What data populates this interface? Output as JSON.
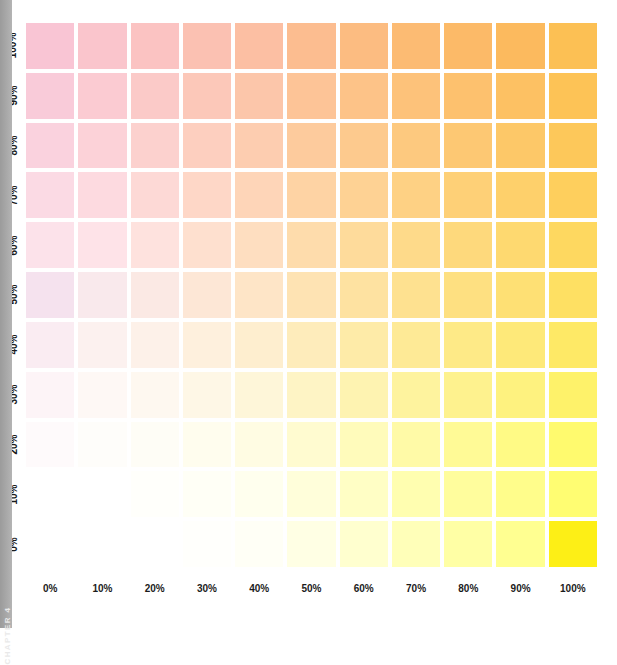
{
  "spine": {
    "chapter_label": "CHAPTER 4",
    "color": "#a6a6a6"
  },
  "chart_data": {
    "type": "heatmap",
    "title": "",
    "xlabel": "",
    "ylabel": "",
    "grid": false,
    "legend": "none",
    "x_axis_name": "yellow_percent",
    "y_axis_name": "magenta_percent",
    "x": [
      "0%",
      "10%",
      "20%",
      "30%",
      "40%",
      "50%",
      "60%",
      "70%",
      "80%",
      "90%",
      "100%"
    ],
    "y": [
      "100%",
      "90%",
      "80%",
      "70%",
      "60%",
      "50%",
      "40%",
      "30%",
      "20%",
      "10%",
      "0%"
    ],
    "x_values": [
      0,
      10,
      20,
      30,
      40,
      50,
      60,
      70,
      80,
      90,
      100
    ],
    "y_values": [
      100,
      90,
      80,
      70,
      60,
      50,
      40,
      30,
      20,
      10,
      0
    ],
    "xlim": [
      0,
      100
    ],
    "ylim": [
      0,
      100
    ],
    "corner_colors": {
      "top_left": "#f9c5d4",
      "top_right": "#fcc054",
      "bottom_left": "#ffffff",
      "bottom_right": "#fdef16"
    },
    "cell_colors": [
      [
        "#f9c5d4",
        "#fac5cc",
        "#fbc3c2",
        "#fbc1b2",
        "#fcbfa3",
        "#fcbd90",
        "#fcbc81",
        "#fcbb73",
        "#fcba68",
        "#fcba5e",
        "#fcc054"
      ],
      [
        "#f9cbd9",
        "#fbcbd2",
        "#fbcac8",
        "#fcc8b9",
        "#fcc6aa",
        "#fdc497",
        "#fdc388",
        "#fdc27a",
        "#fdc16e",
        "#fdc163",
        "#fdc356"
      ],
      [
        "#fad2de",
        "#fcd2d8",
        "#fcd1ce",
        "#fdcfbf",
        "#fdcdb0",
        "#fdcb9d",
        "#fdca8e",
        "#fdc97f",
        "#fdc873",
        "#fdc868",
        "#fdc85a"
      ],
      [
        "#fbdae4",
        "#fddae0",
        "#fdd9d6",
        "#fed7c7",
        "#fed5b8",
        "#fed3a4",
        "#fed294",
        "#fed184",
        "#fed077",
        "#fed06b",
        "#fecf5d"
      ],
      [
        "#fce2ea",
        "#fee3e8",
        "#fee2de",
        "#fee0cf",
        "#fedec0",
        "#fedcac",
        "#fedb9b",
        "#feda8a",
        "#fed97c",
        "#fed970",
        "#fed860"
      ],
      [
        "#f5e2ee",
        "#f9e9ec",
        "#fbe9e4",
        "#fde7d6",
        "#fee5c7",
        "#fee3b3",
        "#fee2a1",
        "#fee190",
        "#fee081",
        "#fee074",
        "#fee063"
      ],
      [
        "#faecf2",
        "#fcf1ef",
        "#fdf1e9",
        "#fef0dd",
        "#feeecf",
        "#feecbb",
        "#feeba8",
        "#feea96",
        "#feea87",
        "#fee979",
        "#fee966"
      ],
      [
        "#fdf4f7",
        "#fef8f5",
        "#fef8f0",
        "#fef7e6",
        "#fef6d9",
        "#fef4c5",
        "#fef3b1",
        "#fef39e",
        "#fef28e",
        "#fef27f",
        "#fef26a"
      ],
      [
        "#fefafb",
        "#fefdfa",
        "#fefdf6",
        "#fffdee",
        "#fffce3",
        "#fffbd0",
        "#fffbbb",
        "#fffaa7",
        "#fffa96",
        "#fffa85",
        "#fffa6e"
      ],
      [
        "#ffffff",
        "#ffffff",
        "#fffffb",
        "#fffff6",
        "#ffffee",
        "#fffeda",
        "#fffec5",
        "#fffeb0",
        "#fffd9d",
        "#fffd8b",
        "#fffd72"
      ],
      [
        "#ffffff",
        "#ffffff",
        "#ffffff",
        "#fffffc",
        "#fffff6",
        "#ffffe4",
        "#ffffcf",
        "#ffffb9",
        "#ffffa5",
        "#ffff91",
        "#fdef16"
      ]
    ]
  }
}
